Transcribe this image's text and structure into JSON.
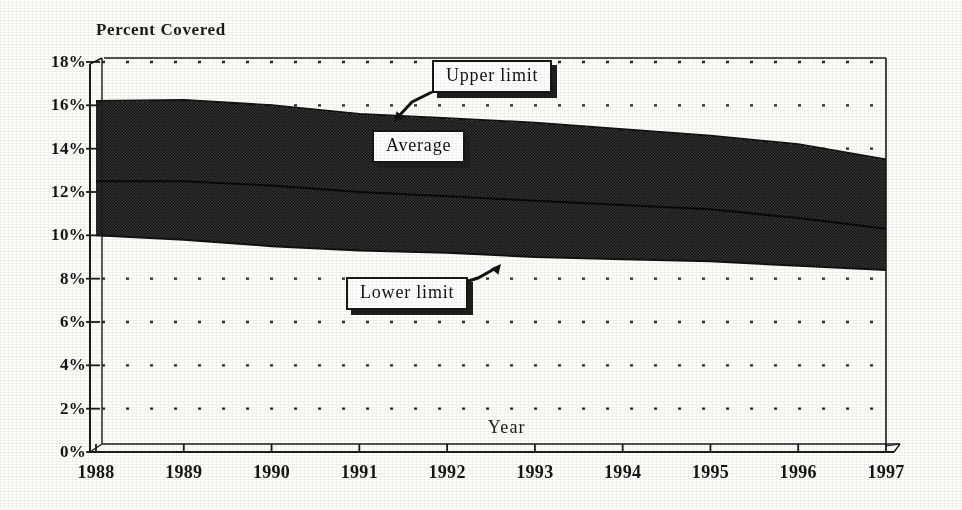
{
  "chart_title": "Percent Covered",
  "axis": {
    "y_label": "Percent Covered",
    "x_label": "Year",
    "y_ticks": [
      "0%",
      "2%",
      "4%",
      "6%",
      "8%",
      "10%",
      "12%",
      "14%",
      "16%",
      "18%"
    ],
    "x_ticks": [
      "1988",
      "1989",
      "1990",
      "1991",
      "1992",
      "1993",
      "1994",
      "1995",
      "1996",
      "1997"
    ]
  },
  "callouts": {
    "upper": "Upper limit",
    "average": "Average",
    "lower": "Lower limit"
  },
  "colors": {
    "band_fill": "#3a3a3a",
    "line": "#121212",
    "gridline": "#2b2b2b",
    "axis": "#1a1a1a",
    "background": "#fdfdfc"
  },
  "chart_data": {
    "type": "area",
    "title": "Percent Covered",
    "xlabel": "Year",
    "ylabel": "Percent Covered",
    "x": [
      1988,
      1989,
      1990,
      1991,
      1992,
      1993,
      1994,
      1995,
      1996,
      1997
    ],
    "xlim": [
      1988,
      1997
    ],
    "ylim": [
      0,
      18
    ],
    "ytick_step": 2,
    "grid": "horizontal-dotted",
    "legend": "callout-labels",
    "series": [
      {
        "name": "Upper limit",
        "values": [
          16.2,
          16.25,
          16.0,
          15.6,
          15.4,
          15.2,
          14.9,
          14.6,
          14.2,
          13.5
        ]
      },
      {
        "name": "Average",
        "values": [
          12.5,
          12.5,
          12.3,
          12.0,
          11.8,
          11.6,
          11.4,
          11.2,
          10.8,
          10.3
        ]
      },
      {
        "name": "Lower limit",
        "values": [
          10.0,
          9.8,
          9.5,
          9.3,
          9.2,
          9.0,
          8.9,
          8.8,
          8.6,
          8.4
        ]
      }
    ]
  },
  "geometry": {
    "plot_left": 96,
    "plot_right": 886,
    "plot_top": 62,
    "plot_bottom": 452
  }
}
